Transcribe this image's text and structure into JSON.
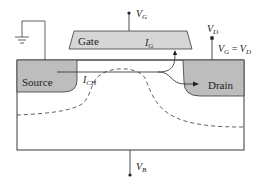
{
  "diagram": {
    "colors": {
      "background": "#ffffff",
      "line": "#3a3a3a",
      "doped_region": "#bdbdbd",
      "gate_fill": "#d6d6d6"
    },
    "regions": {
      "source": {
        "label": "Source"
      },
      "drain": {
        "label": "Drain"
      },
      "gate": {
        "label": "Gate"
      }
    },
    "currents": {
      "channel": {
        "main": "I",
        "sub": "CH"
      },
      "gate": {
        "main": "I",
        "sub": "G"
      }
    },
    "terminals": {
      "gate": {
        "main": "V",
        "sub": "G"
      },
      "drain": {
        "main": "V",
        "sub": "D"
      },
      "body": {
        "main": "V",
        "sub": "B"
      },
      "source": {
        "type": "ground-icon"
      }
    },
    "annotation": {
      "lhs_main": "V",
      "lhs_sub": "G",
      "equals": " = ",
      "rhs_main": "V",
      "rhs_sub": "D"
    },
    "depletion_boundary": {
      "style": "dashed"
    }
  }
}
